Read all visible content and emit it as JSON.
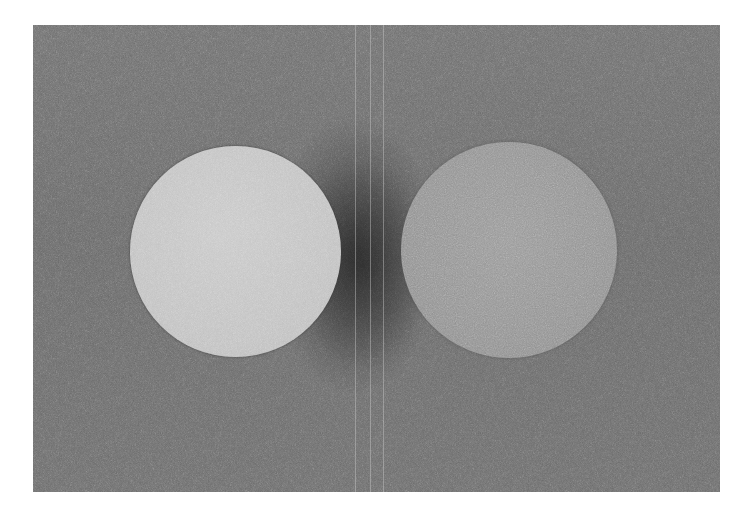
{
  "image": {
    "description": "Noisy grayscale photograph of two spheres on a gray background",
    "background_color": "#6e6e6e",
    "page_color": "#ffffff",
    "objects": [
      {
        "name": "left-sphere",
        "shade": "light gray",
        "color": "#c4c4c4",
        "center": [
          235,
          252
        ],
        "radius": 105
      },
      {
        "name": "right-sphere",
        "shade": "medium gray",
        "color": "#949494",
        "center": [
          508,
          250
        ],
        "radius": 108
      }
    ],
    "shadow": {
      "description": "dark shadow between spheres",
      "color": "#2a2a2a"
    },
    "seams": [
      355,
      370,
      383
    ]
  }
}
